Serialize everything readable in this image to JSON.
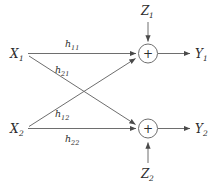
{
  "figure": {
    "type": "block-diagram",
    "background_color": "#ffffff",
    "line_color": "#6e6e6e",
    "text_color": "#2b2b2b"
  },
  "inputs": [
    {
      "base": "X",
      "sub": "1"
    },
    {
      "base": "X",
      "sub": "2"
    }
  ],
  "outputs": [
    {
      "base": "Y",
      "sub": "1"
    },
    {
      "base": "Y",
      "sub": "2"
    }
  ],
  "noises": [
    {
      "base": "Z",
      "sub": "1"
    },
    {
      "base": "Z",
      "sub": "2"
    }
  ],
  "gains": [
    {
      "base": "h",
      "sub": "11"
    },
    {
      "base": "h",
      "sub": "21"
    },
    {
      "base": "h",
      "sub": "12"
    },
    {
      "base": "h",
      "sub": "22"
    }
  ],
  "adders": [
    {
      "symbol": "+"
    },
    {
      "symbol": "+"
    }
  ]
}
